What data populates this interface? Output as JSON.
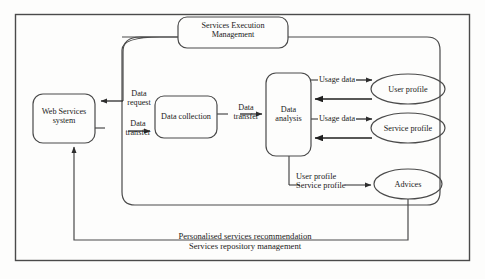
{
  "diagram": {
    "type": "flow-diagram",
    "colors": {
      "background": "#fdfdfc",
      "stroke": "#3a3a3a",
      "text": "#1a1a1a"
    },
    "nodes": {
      "services_execution_management": {
        "label_line1": "Services Execution",
        "label_line2": "Management",
        "shape": "rounded-rect"
      },
      "web_services_system": {
        "label_line1": "Web Services",
        "label_line2": "system",
        "shape": "rounded-rect"
      },
      "data_collection": {
        "label_line1": "Data collection",
        "shape": "rounded-rect"
      },
      "data_analysis": {
        "label_line1": "Data",
        "label_line2": "analysis",
        "shape": "rounded-rect"
      },
      "user_profile": {
        "label_line1": "User profile",
        "shape": "ellipse"
      },
      "service_profile": {
        "label_line1": "Service profile",
        "shape": "ellipse"
      },
      "advices": {
        "label_line1": "Advices",
        "shape": "ellipse"
      }
    },
    "edge_labels": {
      "data_request_l1": "Data",
      "data_request_l2": "request",
      "data_transfer_left_l1": "Data",
      "data_transfer_left_l2": "transfer",
      "data_transfer_right_l1": "Data",
      "data_transfer_right_l2": "transfer",
      "usage_data_user": "Usage data",
      "usage_data_service": "Usage data",
      "profiles_to_advices_l1": "User profile",
      "profiles_to_advices_l2": "Service profile",
      "feedback_l1": "Personalised services recommendation",
      "feedback_l2": "Services repository management"
    }
  }
}
